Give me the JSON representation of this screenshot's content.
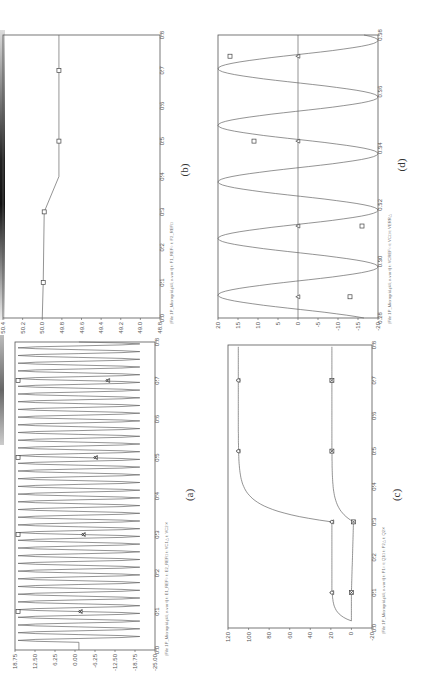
{
  "figure": {
    "orientation": "rotated-90-ccw",
    "panels": [
      "a",
      "b",
      "c",
      "d"
    ]
  },
  "chart_data": [
    {
      "id": "a",
      "caption": "(a)",
      "type": "line",
      "legend": "(File 1P_Microgrid.pl4; x-var t)  t: E1_REF○  t: E2_REF□  t: VC1△  t: VC2✕",
      "legend_entries": [
        "t: E1_REF",
        "t: E2_REF",
        "t: VC1",
        "t: VC2"
      ],
      "xlabel": "t",
      "xticks": [
        "0.0",
        "0.1",
        "0.2",
        "0.3",
        "0.4",
        "0.5",
        "0.6",
        "0.7",
        "0.8"
      ],
      "yticks": [
        "18.75",
        "12.50",
        "6.25",
        "0.00",
        "-6.25",
        "-12.50",
        "-18.75",
        "-25.00"
      ],
      "xlim": [
        0,
        0.8
      ],
      "ylim": [
        -25,
        21
      ],
      "series": [
        {
          "name": "E2_REF",
          "marker": "square",
          "x": [
            0.1,
            0.3,
            0.5,
            0.7
          ],
          "values": [
            20,
            20,
            20,
            20
          ]
        },
        {
          "name": "VC1/VC2",
          "marker": "triangle+x",
          "x": [
            0.1,
            0.3,
            0.5,
            0.7
          ],
          "values": [
            -0.5,
            -1.5,
            -5.5,
            -9.5
          ]
        },
        {
          "name": "oscillation",
          "description": "sinusoid ~ +/-20 amplitude from t=0.02 to 0.8"
        }
      ]
    },
    {
      "id": "b",
      "caption": "(b)",
      "type": "line",
      "legend": "(File 1P_Microgrid.pl4; x-var t)  t: F1_REF○  t: F2_REF□",
      "legend_entries": [
        "t: F1_REF",
        "t: F2_REF"
      ],
      "xlabel": "t",
      "xticks": [
        "0.0",
        "0.1",
        "0.2",
        "0.3",
        "0.4",
        "0.5",
        "0.6",
        "0.7",
        "0.8"
      ],
      "yticks": [
        "50.4",
        "50.2",
        "50.0",
        "49.8",
        "49.6",
        "49.4",
        "49.2",
        "49.0",
        "48.8"
      ],
      "xlim": [
        0,
        0.8
      ],
      "ylim": [
        48.8,
        50.4
      ],
      "series": [
        {
          "name": "F2_REF",
          "marker": "square",
          "x": [
            0.0,
            0.1,
            0.3,
            0.4,
            0.5,
            0.7,
            0.8
          ],
          "values": [
            50.0,
            49.99,
            49.98,
            49.83,
            49.83,
            49.83,
            49.83
          ]
        }
      ]
    },
    {
      "id": "c",
      "caption": "(c)",
      "type": "line",
      "legend": "(File 1P_Microgrid.pl4; x-var t)  t: P1○  t: Q1□  t: P2△  t: Q2✕",
      "legend_entries": [
        "t: P1",
        "t: Q1",
        "t: P2",
        "t: Q2"
      ],
      "xlabel": "t",
      "xticks": [
        "0.0",
        "0.1",
        "0.2",
        "0.3",
        "0.4",
        "0.5",
        "0.6",
        "0.7",
        "0.8"
      ],
      "yticks": [
        "120",
        "100",
        "80",
        "60",
        "40",
        "20",
        "0",
        "-20"
      ],
      "xlim": [
        0,
        0.8
      ],
      "ylim": [
        -20,
        120
      ],
      "series": [
        {
          "name": "P1/P2",
          "marker": "circle+triangle",
          "x": [
            0.02,
            0.1,
            0.3,
            0.4,
            0.5,
            0.7,
            0.8
          ],
          "values": [
            0,
            19,
            19,
            100,
            110,
            110,
            110
          ]
        },
        {
          "name": "Q1/Q2",
          "marker": "square+x",
          "x": [
            0.02,
            0.1,
            0.3,
            0.4,
            0.5,
            0.7,
            0.8
          ],
          "values": [
            0,
            0,
            -2,
            15,
            19,
            19,
            19
          ]
        }
      ]
    },
    {
      "id": "d",
      "caption": "(d)",
      "type": "line",
      "legend": "(File 1P_Microgrid.pl4; x-var t)  t: VCREF○  t: VC□  t: VERR△",
      "legend_entries": [
        "t: VCREF",
        "t: VC",
        "t: VERR"
      ],
      "xlabel": "t",
      "xticks": [
        "0.28",
        "0.30",
        "0.32",
        "0.34",
        "0.36",
        "0.38"
      ],
      "yticks": [
        "20",
        "15",
        "10",
        "5",
        "0",
        "-5",
        "-10",
        "-15",
        "-20"
      ],
      "xlim": [
        0.28,
        0.38
      ],
      "ylim": [
        -20,
        20
      ],
      "series": [
        {
          "name": "VC",
          "marker": "square",
          "x": [
            0.2875,
            0.3125,
            0.3425,
            0.3725
          ],
          "values": [
            -13,
            -16,
            11,
            17
          ]
        },
        {
          "name": "VERR",
          "marker": "triangle",
          "x": [
            0.2875,
            0.3125,
            0.3425,
            0.3725
          ],
          "values": [
            0,
            0,
            0,
            0
          ]
        },
        {
          "name": "VCREF",
          "description": "sinusoid amplitude 20, period 0.02 s"
        }
      ]
    }
  ]
}
